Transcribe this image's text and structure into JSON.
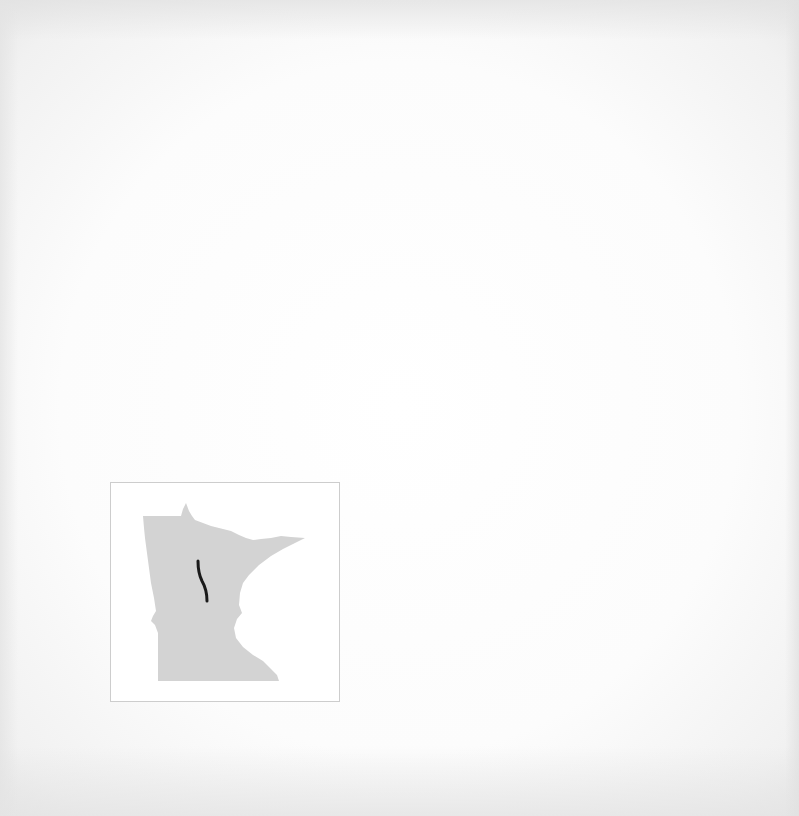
{
  "map": {
    "region": "Minnesota",
    "state_fill": "#d3d3d3",
    "frame_border": "#cdcdcd",
    "route": {
      "color": "#1a1a1a",
      "description": "north-south route segment in north-central Minnesota"
    }
  }
}
